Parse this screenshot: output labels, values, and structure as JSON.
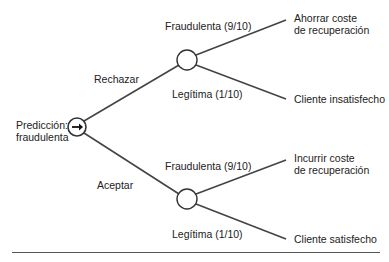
{
  "root": {
    "label_line1": "Predicción:",
    "label_line2": "fraudulenta",
    "icon": "arrow-right-icon"
  },
  "branches": [
    {
      "decision": "Rechazar",
      "outcomes": [
        {
          "event": "Fraudulenta (9/10)",
          "result_line1": "Ahorrar coste",
          "result_line2": "de recuperación"
        },
        {
          "event": "Legítima (1/10)",
          "result_line1": "Cliente insatisfecho",
          "result_line2": ""
        }
      ]
    },
    {
      "decision": "Aceptar",
      "outcomes": [
        {
          "event": "Fraudulenta (9/10)",
          "result_line1": "Incurrir coste",
          "result_line2": "de recuperación"
        },
        {
          "event": "Legítima (1/10)",
          "result_line1": "Cliente satisfecho",
          "result_line2": ""
        }
      ]
    }
  ],
  "colors": {
    "line": "#444444",
    "text": "#222222"
  }
}
